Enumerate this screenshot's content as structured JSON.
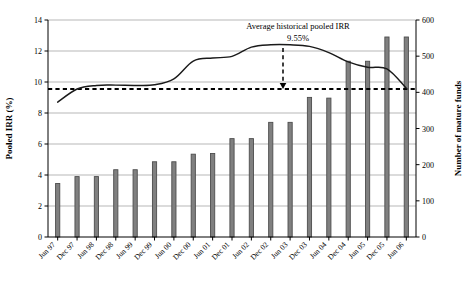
{
  "chart_data": {
    "type": "bar",
    "title": "",
    "subtitle": "",
    "xlabel": "",
    "ylabel": "Pooled IRR (%)",
    "y2label": "Number of mature funds",
    "grid": true,
    "legend": "none",
    "ylim": [
      0,
      14
    ],
    "yticks": [
      "0",
      "2",
      "4",
      "6",
      "8",
      "10",
      "12",
      "14"
    ],
    "y2lim": [
      0,
      600
    ],
    "y2ticks": [
      "0",
      "100",
      "200",
      "300",
      "400",
      "500",
      "600"
    ],
    "categories": [
      "Jun 97",
      "Dec 97",
      "Jun 98",
      "Dec 98",
      "Jun 99",
      "Dec 99",
      "Jun 00",
      "Dec 00",
      "Jun 01",
      "Dec 01",
      "Jun 02",
      "Dec 02",
      "Jun 03",
      "Dec 03",
      "Jun 04",
      "Dec 04",
      "Jun 05",
      "Dec 05",
      "Jun 06"
    ],
    "series": [
      {
        "name": "Number of mature funds",
        "type": "bar",
        "axis": "right",
        "values": [
          148,
          167,
          167,
          186,
          186,
          208,
          208,
          229,
          231,
          272,
          272,
          317,
          317,
          386,
          384,
          486,
          486,
          553,
          553
        ],
        "color": "#808080",
        "edge_color": "#4d4d4d"
      },
      {
        "name": "Pooled IRR (%)",
        "type": "line",
        "axis": "left",
        "values": [
          8.7,
          9.55,
          9.78,
          9.8,
          9.78,
          9.82,
          10.2,
          11.35,
          11.55,
          11.65,
          12.25,
          12.4,
          12.4,
          12.3,
          11.9,
          11.3,
          10.95,
          10.85,
          9.6
        ],
        "color": "#1a1a1a"
      }
    ],
    "annotations": [
      {
        "name": "average-irr-callout",
        "label_line1": "Average historical pooled IRR",
        "label_line2": "9.55%",
        "value": 9.55,
        "style": "dashed-arrow"
      },
      {
        "name": "average-irr-reference-line",
        "value": 9.55,
        "style": "dashed-horizontal"
      }
    ]
  }
}
